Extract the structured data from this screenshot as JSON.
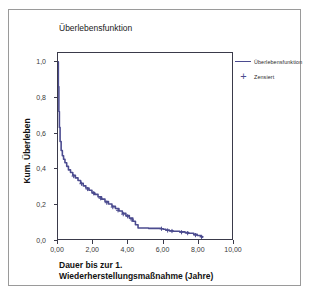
{
  "chart_data": {
    "type": "line",
    "title": "Überlebensfunktion",
    "xlabel": "Dauer bis zur 1. Wiederherstellungsmaßnahme (Jahre)",
    "ylabel": "Kum. Überleben",
    "xlim": [
      0,
      10
    ],
    "ylim": [
      0,
      1.05
    ],
    "grid": false,
    "legend_position": "right",
    "xticks": [
      "0,00",
      "2,00",
      "4,00",
      "6,00",
      "8,00",
      "10,00"
    ],
    "xtick_values": [
      0,
      2,
      4,
      6,
      8,
      10
    ],
    "yticks": [
      "1,0",
      "0,8",
      "0,6",
      "0,4",
      "0,2",
      "0,0"
    ],
    "ytick_values": [
      1.0,
      0.8,
      0.6,
      0.4,
      0.2,
      0.0
    ],
    "series": [
      {
        "name": "Überlebensfunktion",
        "color": "#4b4b8f",
        "x": [
          0,
          0.02,
          0.05,
          0.08,
          0.12,
          0.18,
          0.25,
          0.32,
          0.4,
          0.5,
          0.6,
          0.72,
          0.85,
          1.0,
          1.15,
          1.3,
          1.45,
          1.6,
          1.78,
          1.95,
          2.1,
          2.3,
          2.5,
          2.7,
          2.9,
          3.1,
          3.3,
          3.5,
          3.7,
          3.9,
          4.1,
          4.3,
          4.45,
          4.6,
          5.2,
          5.9,
          6.05,
          6.2,
          6.4,
          6.6,
          7.0,
          7.3,
          7.5,
          7.8,
          8.0,
          8.2,
          8.3
        ],
        "y": [
          1.0,
          0.86,
          0.72,
          0.63,
          0.55,
          0.5,
          0.47,
          0.45,
          0.43,
          0.41,
          0.39,
          0.375,
          0.36,
          0.345,
          0.33,
          0.315,
          0.3,
          0.288,
          0.275,
          0.262,
          0.252,
          0.238,
          0.225,
          0.212,
          0.198,
          0.185,
          0.172,
          0.158,
          0.145,
          0.132,
          0.118,
          0.1,
          0.08,
          0.062,
          0.06,
          0.058,
          0.055,
          0.05,
          0.046,
          0.044,
          0.04,
          0.036,
          0.032,
          0.026,
          0.02,
          0.014,
          0.01
        ]
      }
    ],
    "censored": {
      "name": "Zensiert",
      "marker": "plus",
      "color": "#4b4b8f",
      "x": [
        0.9,
        1.35,
        1.7,
        2.05,
        2.45,
        2.8,
        3.15,
        3.45,
        3.75,
        4.0,
        4.25,
        5.95,
        6.3,
        6.55,
        7.1,
        7.45,
        7.9,
        8.25
      ],
      "y": [
        0.355,
        0.312,
        0.282,
        0.258,
        0.23,
        0.205,
        0.18,
        0.162,
        0.14,
        0.128,
        0.108,
        0.058,
        0.048,
        0.045,
        0.038,
        0.033,
        0.022,
        0.012
      ]
    },
    "legend": [
      {
        "label": "Überlebensfunktion",
        "marker": "line"
      },
      {
        "label": "Zensiert",
        "marker": "plus"
      }
    ]
  }
}
